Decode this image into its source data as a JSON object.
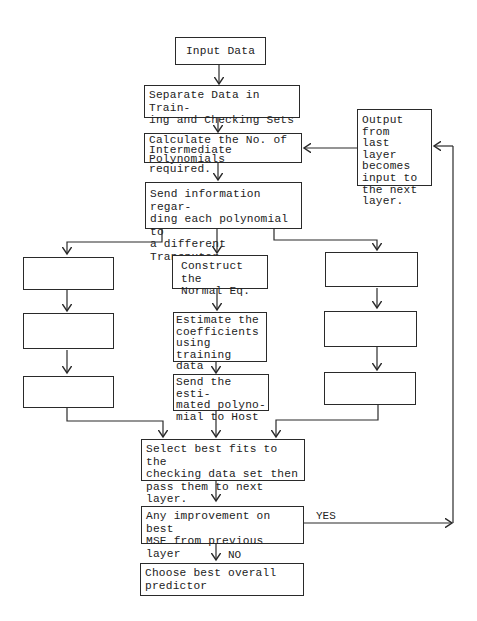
{
  "flowchart": {
    "nodes": {
      "input": "Input Data",
      "separate": "Separate Data in Train-\ning and Checking Sets",
      "calculate": "Calculate the No. of\nIntermediate Polynomials\nrequired.",
      "send_info": "Send information regar-\nding each polynomial to\na different Transputer.",
      "feedback": "Output from\nlast layer\nbecomes\ninput to\nthe next\nlayer.",
      "construct": "Construct the\nNormal Eq.",
      "estimate": "Estimate the\ncoefficients\nusing training\ndata",
      "send_est": "Send the esti-\nmated polyno-\nmial to Host",
      "left_1": "",
      "left_2": "",
      "left_3": "",
      "right_1": "",
      "right_2": "",
      "right_3": "",
      "select": "Select best fits to the\nchecking data set then\npass them to next layer.",
      "improve": "Any improvement on best\nMSE from previous layer",
      "choose": "Choose best overall\npredictor"
    },
    "edge_labels": {
      "yes": "YES",
      "no": "NO"
    }
  }
}
